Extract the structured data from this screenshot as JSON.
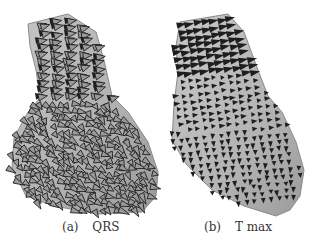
{
  "figure": {
    "panels": [
      {
        "id": "a",
        "label": "(a)",
        "title": "QRS",
        "surface_color": "#b4b4b4",
        "arrow_color": "#1e1e1e",
        "outline": "28,24 68,14 96,32 104,60 112,96 128,112 148,142 158,172 156,196 142,212 98,214 54,206 26,196 12,168 14,138 28,112 40,98 36,70 30,46",
        "arrow_pattern": "dense-crossing"
      },
      {
        "id": "b",
        "label": "(b)",
        "title": "T max",
        "surface_color": "#b6b6b6",
        "arrow_color": "#1e1e1e",
        "outline": "180,22 228,14 244,32 258,70 268,96 282,112 296,142 304,170 300,196 290,210 276,216 244,206 212,190 186,164 172,140 174,104 178,72 176,46",
        "arrow_pattern": "regular-grid"
      }
    ]
  }
}
